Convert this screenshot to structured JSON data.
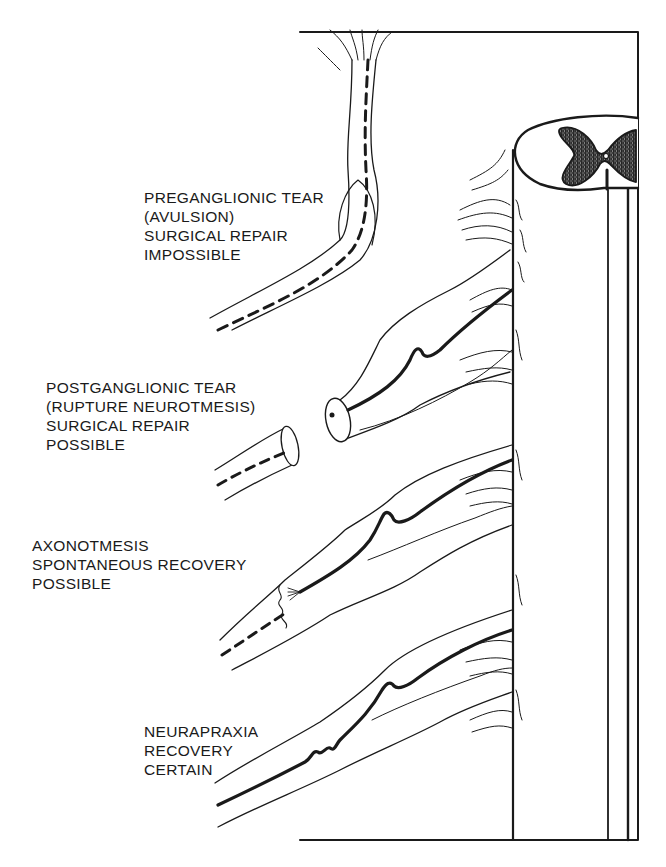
{
  "diagram": {
    "colors": {
      "ink": "#1a1a1a",
      "background": "#ffffff",
      "grey_matter_fill": "#9a9a9a"
    },
    "labels": [
      {
        "id": "preganglionic",
        "lines": [
          "PREGANGLIONIC TEAR",
          "(AVULSION)",
          "SURGICAL REPAIR",
          "IMPOSSIBLE"
        ]
      },
      {
        "id": "postganglionic",
        "lines": [
          "POSTGANGLIONIC TEAR",
          "(RUPTURE NEUROTMESIS)",
          "SURGICAL REPAIR",
          "POSSIBLE"
        ]
      },
      {
        "id": "axonotmesis",
        "lines": [
          "AXONOTMESIS",
          "SPONTANEOUS RECOVERY",
          "POSSIBLE"
        ]
      },
      {
        "id": "neurapraxia",
        "lines": [
          "NEURAPRAXIA",
          "RECOVERY",
          "CERTAIN"
        ]
      }
    ],
    "structures": [
      "spinal-cord-cylinder",
      "spinal-cord-cross-section",
      "grey-matter-butterfly",
      "nerve-root-preganglionic",
      "nerve-root-postganglionic",
      "nerve-root-axonotmesis",
      "nerve-root-neurapraxia"
    ]
  }
}
